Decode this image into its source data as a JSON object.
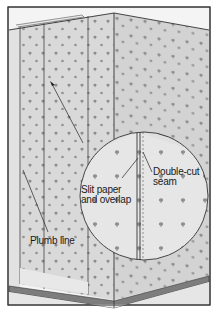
{
  "diagram": {
    "labels": {
      "slit": [
        "Slit paper",
        "and overlap"
      ],
      "seam": [
        "Double-cut",
        "seam"
      ],
      "plumb": "Plumb line"
    },
    "colors": {
      "frame": "#333333",
      "wall": "#d9d9d9",
      "wall_right": "#d2d2d2",
      "ceiling": "#f4f4f4",
      "dot": "#8a8a8a",
      "baseboard": "#7d7d7d",
      "floor": "#e6e6e6",
      "magnifier": "#e8e8e8"
    }
  }
}
